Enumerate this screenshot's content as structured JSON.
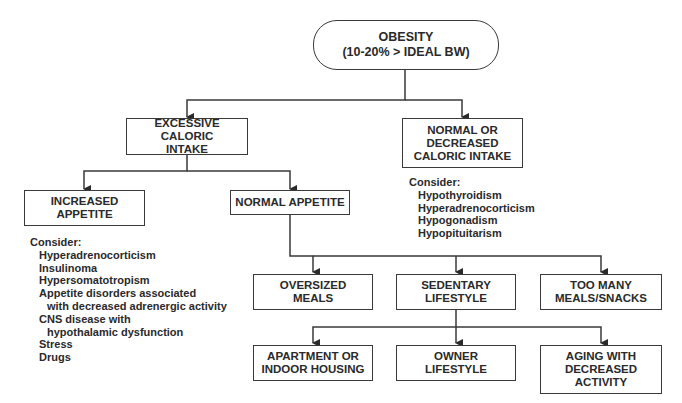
{
  "root": {
    "label": "OBESITY\n(10-20% > IDEAL BW)"
  },
  "level1": {
    "excessive": {
      "label": "EXCESSIVE CALORIC\nINTAKE"
    },
    "normal_decreased": {
      "label": "NORMAL OR\nDECREASED\nCALORIC INTAKE"
    }
  },
  "level2": {
    "increased_appetite": {
      "label": "INCREASED\nAPPETITE"
    },
    "normal_appetite": {
      "label": "NORMAL APPETITE"
    }
  },
  "level3": {
    "oversized_meals": {
      "label": "OVERSIZED\nMEALS"
    },
    "sedentary": {
      "label": "SEDENTARY\nLIFESTYLE"
    },
    "too_many_meals": {
      "label": "TOO MANY\nMEALS/SNACKS"
    }
  },
  "level4": {
    "apartment": {
      "label": "APARTMENT OR\nINDOOR HOUSING"
    },
    "owner": {
      "label": "OWNER\nLIFESTYLE"
    },
    "aging": {
      "label": "AGING WITH\nDECREASED\nACTIVITY"
    }
  },
  "consider_increased": {
    "heading": "Consider:",
    "items": [
      "Hyperadrenocorticism",
      "Insulinoma",
      "Hypersomatotropism",
      "Appetite disorders associated",
      "with decreased adrenergic activity",
      "CNS disease with",
      "hypothalamic dysfunction",
      "Stress",
      "Drugs"
    ]
  },
  "consider_normal": {
    "heading": "Consider:",
    "items": [
      "Hypothyroidism",
      "Hyperadrenocorticism",
      "Hypogonadism",
      "Hypopituitarism"
    ]
  },
  "colors": {
    "line": "#3a3a3a",
    "text": "#2a2a2a"
  }
}
